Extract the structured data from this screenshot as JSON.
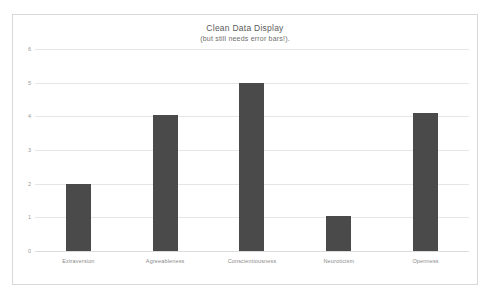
{
  "chart_data": {
    "type": "bar",
    "title": "Clean Data Display",
    "subtitle": "(but still needs error bars!).",
    "categories": [
      "Extraversion",
      "Agreeableness",
      "Conscientiousness",
      "Neuroticism",
      "Openness"
    ],
    "values": [
      2.0,
      4.05,
      5.0,
      1.05,
      4.1
    ],
    "xlabel": "",
    "ylabel": "",
    "ylim": [
      0,
      6
    ],
    "yticks": [
      0,
      1,
      2,
      3,
      4,
      5,
      6
    ],
    "ytick_labels": [
      "0",
      "1",
      "2",
      "3",
      "4",
      "5",
      "6"
    ],
    "grid": true,
    "legend": false,
    "bar_color": "#4a4a4a",
    "gridline_color": "#e6e6e6",
    "frame_color": "#d8d8d8"
  }
}
